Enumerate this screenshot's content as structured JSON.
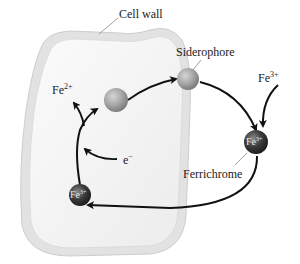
{
  "diagram": {
    "labels": {
      "cell_wall": "Cell wall",
      "siderophore": "Siderophore",
      "ferrichrome": "Ferrichrome",
      "fe3_outside_base": "Fe",
      "fe3_outside_charge": "3+",
      "fe2_base": "Fe",
      "fe2_charge": "2+",
      "electron_base": "e",
      "electron_charge": "−",
      "ferrichrome_ion_base": "Fe",
      "ferrichrome_ion_charge": "3+",
      "inside_ion_base": "Fe",
      "inside_ion_charge": "3+"
    },
    "colors": {
      "cell_wall_fill": "#e4e4e4",
      "cell_wall_stroke": "#cfcfcf",
      "cytoplasm": "#f3f3f3",
      "siderophore_sphere": "#a6a6a6",
      "ferrichrome_sphere": "#3a3a3a",
      "arrow": "#111111"
    }
  }
}
